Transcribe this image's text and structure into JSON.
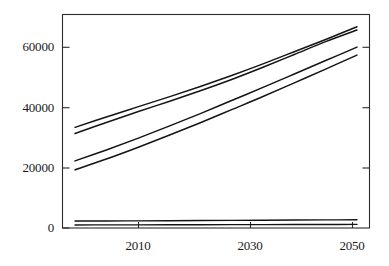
{
  "chart_data": {
    "type": "line",
    "title": "",
    "subtitle": "",
    "xlabel": "",
    "ylabel": "",
    "xlim": [
      2003,
      2052
    ],
    "ylim": [
      0,
      70000
    ],
    "xticks": [
      2010,
      2030,
      2050
    ],
    "yticks": [
      0,
      20000,
      40000,
      60000
    ],
    "xtick_labels": [
      "2010",
      "2030",
      "2050"
    ],
    "ytick_labels": [
      "0",
      "20000",
      "40000",
      "60000"
    ],
    "grid": false,
    "legend": "none",
    "frame": "box",
    "x": [
      2005,
      2010,
      2015,
      2020,
      2025,
      2030,
      2035,
      2040,
      2045,
      2050
    ],
    "series": [
      {
        "name": "upper-band-high",
        "values": [
          33000,
          36400,
          39700,
          43000,
          46400,
          50000,
          53800,
          57800,
          61800,
          66000
        ]
      },
      {
        "name": "upper-band-low",
        "values": [
          31000,
          34600,
          38100,
          41500,
          45000,
          48700,
          52700,
          56900,
          61100,
          64900
        ]
      },
      {
        "name": "lower-band-high",
        "values": [
          22000,
          25600,
          29400,
          33400,
          37500,
          41800,
          46100,
          50500,
          54900,
          59300
        ]
      },
      {
        "name": "lower-band-low",
        "values": [
          19100,
          22600,
          26400,
          30400,
          34500,
          38800,
          43100,
          47600,
          52100,
          56700
        ]
      },
      {
        "name": "flat-band-high",
        "values": [
          2300,
          2300,
          2350,
          2400,
          2450,
          2500,
          2550,
          2600,
          2650,
          2700
        ]
      },
      {
        "name": "flat-band-low",
        "values": [
          1000,
          1020,
          1040,
          1060,
          1080,
          1100,
          1120,
          1140,
          1160,
          1180
        ]
      }
    ],
    "axis_colors": {
      "frame": "#2b2b2b",
      "line": "#141414",
      "background": "#ffffff"
    }
  },
  "axes": {
    "y_labels": [
      "60000",
      "40000",
      "20000",
      "0"
    ],
    "x_labels": [
      "2010",
      "2030",
      "2050"
    ]
  }
}
